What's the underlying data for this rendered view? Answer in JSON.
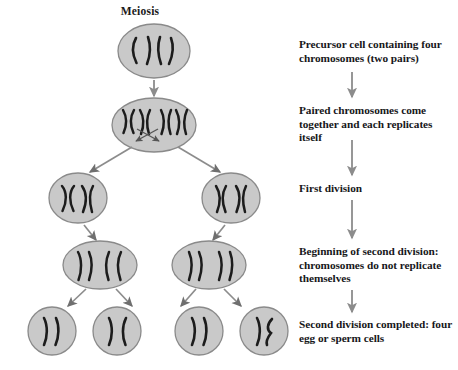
{
  "figure": {
    "title": "Meiosis",
    "background_color": "#ffffff",
    "cell_fill_color": "#c9c9c9",
    "cell_stroke_color": "#8a8a8a",
    "chromosome_color": "#1c1c1c",
    "arrow_color": "#8c8c8c",
    "text_color": "#17171a"
  },
  "captions": [
    {
      "id": "precursor-cell",
      "text": "Precursor cell containing four chromosomes (two pairs)"
    },
    {
      "id": "paired-replicates",
      "text": "Paired chromosomes come together and each replicates itself"
    },
    {
      "id": "first-division",
      "text": "First division"
    },
    {
      "id": "second-division-beginning",
      "text": "Beginning of second division:  chromosomes do not replicate themselves"
    },
    {
      "id": "second-division-completed",
      "text": "Second division completed: four egg or sperm cells"
    }
  ],
  "stages": [
    {
      "id": "stage-1-precursor",
      "label": "Precursor cell",
      "cell_count": 1,
      "chromosomes_per_cell": 4,
      "chromosome_shape": "single-strand"
    },
    {
      "id": "stage-2-replicated",
      "label": "Replicated paired chromosomes",
      "cell_count": 1,
      "chromosomes_per_cell": 4,
      "chromosome_shape": "x-shaped-replicated"
    },
    {
      "id": "stage-3-first-division",
      "label": "Two cells after first division",
      "cell_count": 2,
      "chromosomes_per_cell": 2,
      "chromosome_shape": "x-shaped-replicated"
    },
    {
      "id": "stage-4-second-division",
      "label": "Two cells beginning second division",
      "cell_count": 2,
      "chromosomes_per_cell": 4,
      "chromosome_shape": "separating-chromatids"
    },
    {
      "id": "stage-5-gametes",
      "label": "Four egg or sperm cells",
      "cell_count": 4,
      "chromosomes_per_cell": 2,
      "chromosome_shape": "single-strand"
    }
  ],
  "annotations": {
    "crossing_over": "crossing-over arrows between homologous chromosome pairs"
  }
}
